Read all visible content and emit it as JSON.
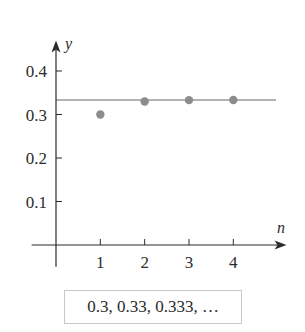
{
  "chart_data": {
    "type": "scatter",
    "title": "",
    "xlabel": "n",
    "ylabel": "y",
    "x": [
      1,
      2,
      3,
      4
    ],
    "series": [
      {
        "name": "sequence",
        "values": [
          0.3,
          0.33,
          0.333,
          0.3333
        ],
        "color": "#8c8c8c"
      }
    ],
    "reference_line": {
      "orientation": "horizontal",
      "y": 0.3333333,
      "color": "#9a9a9a"
    },
    "xticks": [
      1,
      2,
      3,
      4
    ],
    "xtick_labels": [
      "1",
      "2",
      "3",
      "4"
    ],
    "yticks": [
      0.1,
      0.2,
      0.3,
      0.4
    ],
    "ytick_labels": [
      "0.1",
      "0.2",
      "0.3",
      "0.4"
    ],
    "xlim": [
      -0.55,
      5.2
    ],
    "ylim": [
      -0.05,
      0.47
    ],
    "grid": false,
    "legend": "none"
  },
  "caption": "0.3, 0.33, 0.333, …",
  "colors": {
    "axis": "#2b2b2b",
    "point": "#8c8c8c",
    "line": "#9a9a9a"
  }
}
